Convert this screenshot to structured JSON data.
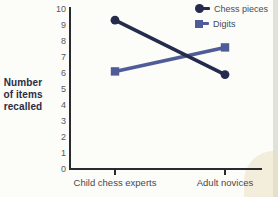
{
  "chart_data": {
    "type": "line",
    "title": "",
    "categories": [
      "Child chess experts",
      "Adult novices"
    ],
    "series": [
      {
        "name": "Chess pieces",
        "marker": "circle",
        "color": "#252b4d",
        "values": [
          9.3,
          5.9
        ]
      },
      {
        "name": "Digits",
        "marker": "square",
        "color": "#4f5c97",
        "values": [
          6.1,
          7.6
        ]
      }
    ],
    "ylabel_lines": [
      "Number",
      "of items",
      "recalled"
    ],
    "yticks": [
      0,
      1,
      2,
      3,
      4,
      5,
      6,
      7,
      8,
      9,
      10
    ],
    "ylim": [
      0,
      10
    ],
    "grid": false,
    "legend_position": "top-right"
  },
  "palette": {
    "background": "#fcfcf8",
    "axis": "#2a2a31",
    "tick_text": "#57575f",
    "category_text": "#47484f",
    "ylabel_text": "#2b2c44",
    "legend_text": "#454b5e",
    "scan_edge": "#dcdfd0",
    "scan_corner": "#eaddc0"
  }
}
